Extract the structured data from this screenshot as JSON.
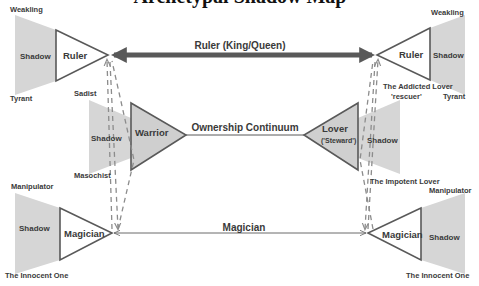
{
  "title": "Archetypal Shadow Map",
  "nodes": {
    "ruler_left": {
      "label": "Ruler",
      "shadow": "Shadow",
      "shadow_top": "Weakling",
      "shadow_bottom": "Tyrant"
    },
    "ruler_right": {
      "label": "Ruler",
      "shadow": "Shadow",
      "shadow_top": "Weakling",
      "shadow_bottom": "Tyrant"
    },
    "warrior": {
      "label": "Warrior",
      "shadow": "Shadow",
      "shadow_top": "Sadist",
      "shadow_bottom": "Masochist"
    },
    "lover": {
      "label": "Lover",
      "sublabel": "('Steward')",
      "shadow": "Shadow",
      "shadow_top": "The Addicted Lover",
      "shadow_top_sub": "'rescuer'",
      "shadow_bottom": "The Impotent Lover"
    },
    "magician_left": {
      "label": "Magician",
      "shadow": "Shadow",
      "shadow_top": "Manipulator",
      "shadow_bottom": "The Innocent One"
    },
    "magician_right": {
      "label": "Magician",
      "shadow": "Shadow",
      "shadow_top": "Manipulator",
      "shadow_bottom": "The Innocent One"
    }
  },
  "connectors": {
    "ruler": "Ruler (King/Queen)",
    "ownership": "Ownership Continuum",
    "magician": "Magician"
  },
  "colors": {
    "shadow_fill": "#d4d4d4",
    "triangle_stroke": "#595959",
    "warrior_fill": "#cfcfcf",
    "thick_arrow": "#595959",
    "dashed": "#9a9a9a"
  }
}
